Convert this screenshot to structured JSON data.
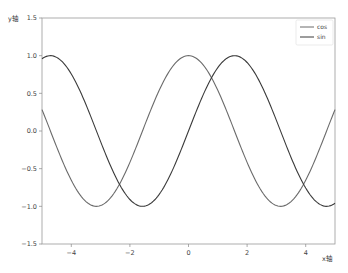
{
  "chart_data": {
    "type": "line",
    "title": "",
    "xlabel": "x轴",
    "ylabel": "y轴",
    "xlim": [
      -5,
      5
    ],
    "ylim": [
      -1.5,
      1.5
    ],
    "x_ticks": [
      -4,
      -2,
      0,
      2,
      4
    ],
    "x_tick_labels": [
      "−4",
      "−2",
      "0",
      "2",
      "4"
    ],
    "y_ticks": [
      1.5,
      1.0,
      0.5,
      0.0,
      -0.5,
      -1.0,
      -1.5
    ],
    "y_tick_labels": [
      "1.5",
      "1.0",
      "0.5",
      "0.0",
      "−0.5",
      "−1.0",
      "−1.5"
    ],
    "grid": false,
    "legend_position": "upper right",
    "series": [
      {
        "name": "cos",
        "function": "cos(x)",
        "color": "#6b6b6b",
        "x": [
          -5,
          -4,
          -3,
          -2,
          -1,
          0,
          1,
          2,
          3,
          4,
          5
        ],
        "values": [
          0.28,
          -0.65,
          -0.99,
          -0.42,
          0.54,
          1.0,
          0.54,
          -0.42,
          -0.99,
          -0.65,
          0.28
        ]
      },
      {
        "name": "sin",
        "function": "sin(x)",
        "color": "#3a3a3a",
        "x": [
          -5,
          -4,
          -3,
          -2,
          -1,
          0,
          1,
          2,
          3,
          4,
          5
        ],
        "values": [
          0.96,
          0.76,
          -0.14,
          -0.91,
          -0.84,
          0.0,
          0.84,
          0.91,
          0.14,
          -0.76,
          -0.96
        ]
      }
    ]
  },
  "legend": {
    "items": [
      {
        "label": "cos"
      },
      {
        "label": "sin"
      }
    ]
  },
  "axes": {
    "xlabel": "x轴",
    "ylabel": "y轴"
  }
}
